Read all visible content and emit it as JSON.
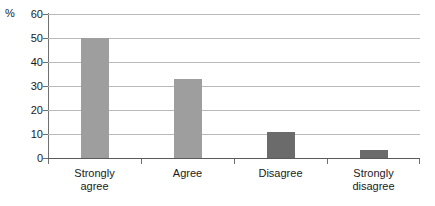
{
  "chart_data": {
    "type": "bar",
    "title": "",
    "xlabel": "",
    "ylabel": "%",
    "unit_label": "%",
    "categories": [
      "Strongly agree",
      "Agree",
      "Disagree",
      "Strongly disagree"
    ],
    "values": [
      50,
      33,
      11,
      3.5
    ],
    "ylim": [
      0,
      60
    ],
    "yticks": [
      0,
      10,
      20,
      30,
      40,
      50,
      60
    ],
    "ytick_labels": [
      "0",
      "10",
      "20",
      "30",
      "40",
      "50",
      "60"
    ],
    "grid": true,
    "legend": null,
    "bar_colors": [
      "#9e9e9e",
      "#9e9e9e",
      "#6b6b6b",
      "#6b6b6b"
    ],
    "series": [
      {
        "name": "Responses",
        "values": [
          50,
          33,
          11,
          3.5
        ]
      }
    ]
  },
  "axis": {
    "unit": "%",
    "tick_0": "0",
    "tick_1": "10",
    "tick_2": "20",
    "tick_3": "30",
    "tick_4": "40",
    "tick_5": "50",
    "tick_6": "60"
  },
  "categories": {
    "c0_line1": "Strongly",
    "c0_line2": "agree",
    "c1_line1": "Agree",
    "c1_line2": "",
    "c2_line1": "Disagree",
    "c2_line2": "",
    "c3_line1": "Strongly",
    "c3_line2": "disagree"
  }
}
